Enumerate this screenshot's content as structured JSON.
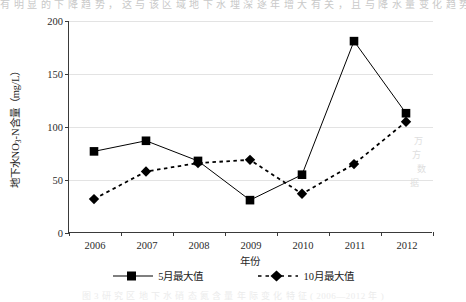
{
  "page": {
    "top_text_line": "有 明 显 的 下 降 趋 势 ， 这 与 该 区 域 地 下 水 埋 深 逐 年 增 大 有 关 ， 且 与 降 水 量 变 化 趋 势 基 本 一 致",
    "bottom_caption": "图 3   研 究 区 地 下 水 硝 态 氮 含 量 年 际 变 化 特 征 ( 2006—2012 年 )",
    "watermark_marks": [
      "万",
      "方",
      "数",
      "据"
    ]
  },
  "chart_data": {
    "type": "line",
    "title": "",
    "xlabel": "年份",
    "ylabel": "地下水NO3-N含量（mg/L）",
    "ylabel_parts": {
      "before": "地下水NO",
      "sub": "3",
      "after": "-N含量（mg/L）"
    },
    "categories": [
      "2006",
      "2007",
      "2008",
      "2009",
      "2010",
      "2011",
      "2012"
    ],
    "x": [
      2006,
      2007,
      2008,
      2009,
      2010,
      2011,
      2012
    ],
    "ylim": [
      0,
      200
    ],
    "yticks": [
      0,
      50,
      100,
      150,
      200
    ],
    "ytick_labels": [
      "0",
      "50",
      "100",
      "150",
      "200"
    ],
    "grid": "horizontal",
    "legend_position": "bottom",
    "series": [
      {
        "name": "5月最大值",
        "marker": "square",
        "linestyle": "solid",
        "color": "#000000",
        "values": [
          77,
          87,
          68,
          31,
          55,
          181,
          113
        ]
      },
      {
        "name": "10月最大值",
        "marker": "diamond",
        "linestyle": "dashed",
        "color": "#000000",
        "values": [
          32,
          58,
          66,
          69,
          37,
          65,
          105
        ]
      }
    ]
  },
  "legend": {
    "entries": [
      {
        "label": "5月最大值",
        "marker": "square-solid-line"
      },
      {
        "label": "10月最大值",
        "marker": "diamond-dashed-line"
      }
    ]
  }
}
